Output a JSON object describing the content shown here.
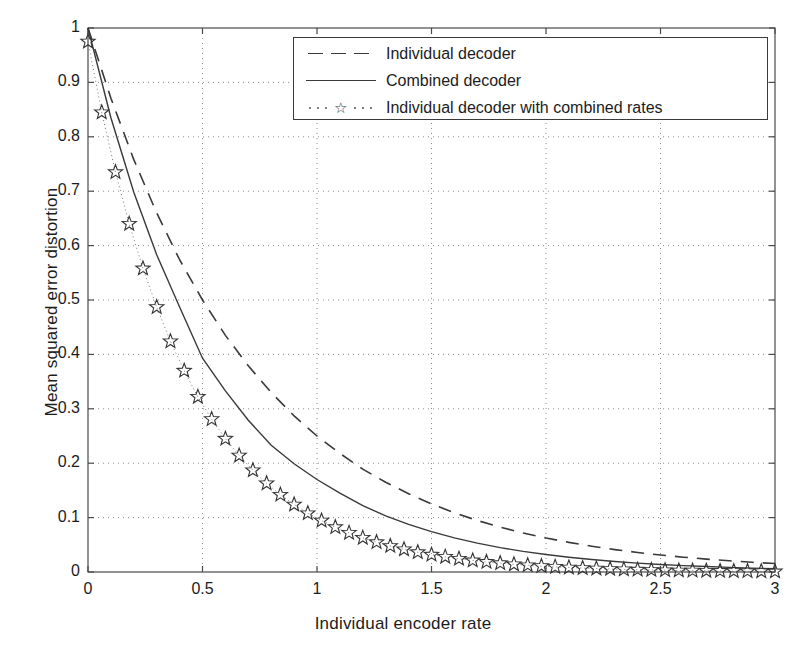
{
  "chart_data": {
    "type": "line",
    "title": "",
    "xlabel": "Individual encoder rate",
    "ylabel": "Mean squared error distortion",
    "xlim": [
      0,
      3
    ],
    "ylim": [
      0,
      1
    ],
    "xticks": [
      0,
      0.5,
      1,
      1.5,
      2,
      2.5,
      3
    ],
    "xticklabels": [
      "0",
      "0.5",
      "1",
      "1.5",
      "2",
      "2.5",
      "3"
    ],
    "yticks": [
      0,
      0.1,
      0.2,
      0.3,
      0.4,
      0.5,
      0.6,
      0.7,
      0.8,
      0.9,
      1
    ],
    "yticklabels": [
      "0",
      "0.1",
      "0.2",
      "0.3",
      "0.4",
      "0.5",
      "0.6",
      "0.7",
      "0.8",
      "0.9",
      "1"
    ],
    "grid": true,
    "grid_style": "dotted",
    "legend_position": "upper-center",
    "line_color": "#3a3a3a",
    "grid_color": "#8c8c8c",
    "axis_color": "#4a4a4a",
    "series": [
      {
        "name": "Individual decoder",
        "style": "dashed",
        "marker": "none",
        "x": [
          0,
          0.1,
          0.2,
          0.3,
          0.4,
          0.5,
          0.6,
          0.7,
          0.8,
          0.9,
          1.0,
          1.1,
          1.2,
          1.3,
          1.4,
          1.5,
          1.6,
          1.7,
          1.8,
          1.9,
          2.0,
          2.1,
          2.2,
          2.3,
          2.4,
          2.5,
          2.6,
          2.7,
          2.8,
          2.9,
          3.0
        ],
        "y": [
          1.0,
          0.871,
          0.758,
          0.66,
          0.574,
          0.5,
          0.435,
          0.379,
          0.33,
          0.287,
          0.25,
          0.218,
          0.189,
          0.165,
          0.144,
          0.125,
          0.109,
          0.0947,
          0.0825,
          0.0718,
          0.0625,
          0.0544,
          0.0474,
          0.0412,
          0.0359,
          0.0312,
          0.0272,
          0.0237,
          0.0206,
          0.0179,
          0.0156
        ]
      },
      {
        "name": "Combined decoder",
        "style": "solid",
        "marker": "none",
        "x": [
          0,
          0.1,
          0.2,
          0.3,
          0.4,
          0.5,
          0.6,
          0.7,
          0.8,
          0.9,
          1.0,
          1.1,
          1.2,
          1.3,
          1.4,
          1.5,
          1.6,
          1.7,
          1.8,
          1.9,
          2.0,
          2.1,
          2.2,
          2.3,
          2.4,
          2.5,
          2.6,
          2.7,
          2.8,
          2.9,
          3.0
        ],
        "y": [
          1.0,
          0.835,
          0.698,
          0.583,
          0.487,
          0.393,
          0.333,
          0.279,
          0.233,
          0.199,
          0.17,
          0.145,
          0.122,
          0.103,
          0.0875,
          0.0742,
          0.0628,
          0.0531,
          0.0449,
          0.038,
          0.0321,
          0.0272,
          0.023,
          0.0194,
          0.0164,
          0.0139,
          0.0118,
          0.01,
          0.0085,
          0.0072,
          0.0061
        ]
      },
      {
        "name": "Individual decoder with combined rates",
        "style": "dotted",
        "marker": "star",
        "x": [
          0,
          0.06,
          0.12,
          0.18,
          0.24,
          0.3,
          0.36,
          0.42,
          0.48,
          0.54,
          0.6,
          0.66,
          0.72,
          0.78,
          0.84,
          0.9,
          0.96,
          1.02,
          1.08,
          1.14,
          1.2,
          1.26,
          1.32,
          1.38,
          1.44,
          1.5,
          1.56,
          1.62,
          1.68,
          1.74,
          1.8,
          1.86,
          1.92,
          1.98,
          2.04,
          2.1,
          2.16,
          2.22,
          2.28,
          2.34,
          2.4,
          2.46,
          2.52,
          2.58,
          2.64,
          2.7,
          2.76,
          2.82,
          2.88,
          2.94,
          3.0
        ],
        "y": [
          0.975,
          0.845,
          0.735,
          0.64,
          0.558,
          0.487,
          0.424,
          0.37,
          0.322,
          0.281,
          0.245,
          0.214,
          0.187,
          0.163,
          0.142,
          0.124,
          0.108,
          0.0945,
          0.0824,
          0.0719,
          0.0628,
          0.0548,
          0.0478,
          0.0417,
          0.0364,
          0.0318,
          0.0278,
          0.0243,
          0.0212,
          0.0185,
          0.0162,
          0.0141,
          0.0124,
          0.0108,
          0.0094,
          0.0082,
          0.0072,
          0.0063,
          0.0055,
          0.0048,
          0.0042,
          0.0037,
          0.0032,
          0.0028,
          0.0025,
          0.0022,
          0.0019,
          0.0017,
          0.0015,
          0.0013,
          0.0011
        ]
      }
    ]
  },
  "legend": {
    "items": [
      {
        "label": "Individual decoder",
        "style": "dashed"
      },
      {
        "label": "Combined decoder",
        "style": "solid"
      },
      {
        "label": "Individual decoder with combined rates",
        "style": "dotted-star"
      }
    ]
  }
}
